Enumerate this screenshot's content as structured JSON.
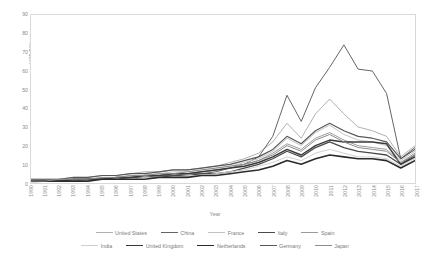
{
  "chart_data": {
    "type": "line",
    "title": "",
    "xlabel": "Year",
    "ylabel": "US$ Billions",
    "ylim": [
      0,
      90
    ],
    "ytick_step": 10,
    "yticks": [
      0,
      10,
      20,
      30,
      40,
      50,
      60,
      70,
      80,
      90
    ],
    "grid": false,
    "legend_position": "bottom",
    "x": [
      1990,
      1991,
      1992,
      1993,
      1994,
      1995,
      1996,
      1997,
      1998,
      1999,
      2000,
      2001,
      2002,
      2003,
      2004,
      2005,
      2006,
      2007,
      2008,
      2009,
      2010,
      2011,
      2012,
      2013,
      2014,
      2015,
      2016,
      2017
    ],
    "categories": [
      "1990",
      "1991",
      "1992",
      "1993",
      "1994",
      "1995",
      "1996",
      "1997",
      "1998",
      "1999",
      "2000",
      "2001",
      "2002",
      "2003",
      "2004",
      "2005",
      "2006",
      "2007",
      "2008",
      "2009",
      "2010",
      "2011",
      "2012",
      "2013",
      "2014",
      "2015",
      "2016",
      "2017"
    ],
    "series": [
      {
        "name": "United States",
        "color": "#b0b0b0",
        "width": 1.0,
        "values": [
          2,
          2,
          2,
          3,
          3,
          4,
          4,
          5,
          6,
          6,
          7,
          7,
          8,
          9,
          11,
          13,
          16,
          22,
          32,
          24,
          37,
          45,
          37,
          30,
          28,
          25,
          14,
          20
        ]
      },
      {
        "name": "China",
        "color": "#636363",
        "width": 1.0,
        "values": [
          1,
          1,
          1,
          2,
          2,
          2,
          3,
          3,
          3,
          4,
          4,
          5,
          5,
          6,
          8,
          10,
          14,
          25,
          47,
          33,
          51,
          62,
          74,
          61,
          60,
          48,
          13,
          19
        ]
      },
      {
        "name": "France",
        "color": "#c2c2c2",
        "width": 1.0,
        "values": [
          1,
          1,
          2,
          2,
          2,
          3,
          3,
          4,
          4,
          5,
          6,
          6,
          7,
          8,
          9,
          11,
          13,
          17,
          24,
          20,
          27,
          31,
          26,
          23,
          22,
          20,
          12,
          17
        ]
      },
      {
        "name": "Italy",
        "color": "#4a4a4a",
        "width": 1.3,
        "values": [
          1,
          1,
          1,
          1,
          2,
          2,
          2,
          3,
          3,
          3,
          4,
          4,
          5,
          5,
          6,
          8,
          10,
          13,
          17,
          14,
          19,
          22,
          19,
          17,
          16,
          15,
          10,
          15
        ]
      },
      {
        "name": "Spain",
        "color": "#9a9a9a",
        "width": 1.0,
        "values": [
          1,
          1,
          1,
          2,
          2,
          2,
          3,
          3,
          4,
          4,
          5,
          5,
          6,
          7,
          8,
          10,
          12,
          16,
          21,
          18,
          24,
          27,
          23,
          20,
          19,
          18,
          11,
          16
        ]
      },
      {
        "name": "India",
        "color": "#cfcfcf",
        "width": 1.0,
        "values": [
          0,
          1,
          1,
          1,
          1,
          2,
          2,
          2,
          3,
          3,
          3,
          4,
          4,
          5,
          6,
          7,
          9,
          11,
          14,
          12,
          16,
          18,
          16,
          14,
          14,
          13,
          9,
          13
        ]
      },
      {
        "name": "United Kingdom",
        "color": "#3a3a3a",
        "width": 1.5,
        "values": [
          1,
          1,
          1,
          2,
          2,
          2,
          3,
          3,
          4,
          4,
          5,
          5,
          6,
          7,
          8,
          9,
          11,
          14,
          18,
          15,
          20,
          23,
          22,
          22,
          22,
          21,
          10,
          14
        ]
      },
      {
        "name": "Netherlands",
        "color": "#2b2b2b",
        "width": 1.6,
        "values": [
          1,
          1,
          1,
          1,
          1,
          2,
          2,
          2,
          2,
          3,
          3,
          3,
          4,
          4,
          5,
          6,
          7,
          9,
          12,
          10,
          13,
          15,
          14,
          13,
          13,
          12,
          8,
          12
        ]
      },
      {
        "name": "Germany",
        "color": "#585858",
        "width": 1.2,
        "values": [
          2,
          2,
          2,
          3,
          3,
          4,
          4,
          5,
          5,
          6,
          7,
          7,
          8,
          9,
          10,
          12,
          14,
          18,
          25,
          21,
          28,
          32,
          28,
          25,
          24,
          22,
          13,
          18
        ]
      },
      {
        "name": "Japan",
        "color": "#8c8c8c",
        "width": 1.0,
        "values": [
          1,
          1,
          2,
          2,
          2,
          3,
          3,
          4,
          4,
          5,
          5,
          6,
          7,
          8,
          9,
          10,
          12,
          15,
          20,
          17,
          23,
          26,
          22,
          19,
          18,
          17,
          11,
          15
        ]
      }
    ]
  },
  "legend": {
    "rows": [
      [
        "United States",
        "China",
        "France",
        "Italy",
        "Spain"
      ],
      [
        "India",
        "United Kingdom",
        "Netherlands",
        "Germany",
        "Japan"
      ]
    ]
  }
}
